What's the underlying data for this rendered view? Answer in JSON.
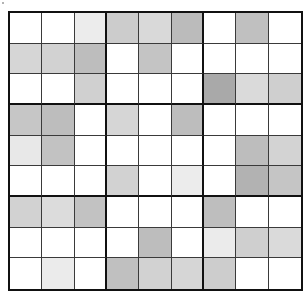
{
  "puzzle": {
    "type": "9x9 shaded grid",
    "rows": 9,
    "cols": 9,
    "box_size": 3,
    "colors": {
      "border": "#111111",
      "thin_line": "#3a3a3a",
      "background": "#ffffff"
    },
    "cells": [
      [
        "#ffffff",
        "#ffffff",
        "#ececec",
        "#cccccc",
        "#d9d9d9",
        "#bbbbbb",
        "#ffffff",
        "#c0c0c0",
        "#ffffff"
      ],
      [
        "#d6d6d6",
        "#d2d2d2",
        "#bdbdbd",
        "#ffffff",
        "#c4c4c4",
        "#ffffff",
        "#ffffff",
        "#ffffff",
        "#ffffff"
      ],
      [
        "#ffffff",
        "#ffffff",
        "#d0d0d0",
        "#ffffff",
        "#ffffff",
        "#ffffff",
        "#a9a9a9",
        "#dadada",
        "#cfcfcf"
      ],
      [
        "#c6c6c6",
        "#bdbdbd",
        "#ffffff",
        "#d6d6d6",
        "#ffffff",
        "#bdbdbd",
        "#ffffff",
        "#ffffff",
        "#ffffff"
      ],
      [
        "#e8e8e8",
        "#c2c2c2",
        "#ffffff",
        "#ffffff",
        "#ffffff",
        "#ffffff",
        "#ffffff",
        "#bdbdbd",
        "#d3d3d3"
      ],
      [
        "#ffffff",
        "#ffffff",
        "#ffffff",
        "#d2d2d2",
        "#ffffff",
        "#ececec",
        "#ffffff",
        "#b2b2b2",
        "#c5c5c5"
      ],
      [
        "#d2d2d2",
        "#dcdcdc",
        "#c2c2c2",
        "#ffffff",
        "#ffffff",
        "#ffffff",
        "#bebebe",
        "#ffffff",
        "#ffffff"
      ],
      [
        "#ffffff",
        "#ffffff",
        "#ffffff",
        "#ffffff",
        "#bdbdbd",
        "#ffffff",
        "#ebebeb",
        "#cfcfcf",
        "#dadada"
      ],
      [
        "#ffffff",
        "#ebebeb",
        "#ffffff",
        "#c0c0c0",
        "#d2d2d2",
        "#d6d6d6",
        "#cdcdcd",
        "#ffffff",
        "#ffffff"
      ]
    ]
  }
}
